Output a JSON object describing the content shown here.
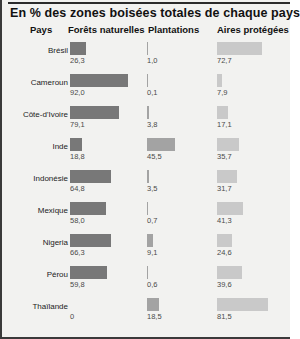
{
  "title": "En % des zones boisées totales de chaque pays",
  "columns": [
    "Pays",
    "Forêts naturelles",
    "Plantations",
    "Aires protégées"
  ],
  "colors": {
    "natural_forest": "#787878",
    "plantations": "#a3a3a3",
    "protected_areas": "#c9c9c9",
    "panel_background": "#f2f2f0",
    "frame": "#3a3a3a",
    "title_text": "#111111",
    "value_text": "#4a4a4a"
  },
  "chart_data": {
    "type": "bar",
    "title": "En % des zones boisées totales de chaque pays",
    "xlabel": "",
    "ylabel": "",
    "xlim": [
      0,
      100
    ],
    "grid": false,
    "legend_position": "column-headers",
    "orientation": "horizontal",
    "unit": "%",
    "categories": [
      "Brésil",
      "Cameroun",
      "Côte-d'Ivoire",
      "Inde",
      "Indonésie",
      "Mexique",
      "Nigeria",
      "Pérou",
      "Thaïlande"
    ],
    "series": [
      {
        "name": "Forêts naturelles",
        "color": "#787878",
        "values": [
          26.3,
          92.0,
          79.1,
          18.8,
          64.8,
          58.0,
          66.3,
          59.8,
          0
        ]
      },
      {
        "name": "Plantations",
        "color": "#a3a3a3",
        "values": [
          1.0,
          0.1,
          3.8,
          45.5,
          3.5,
          0.7,
          9.1,
          0.6,
          18.5
        ]
      },
      {
        "name": "Aires protégées",
        "color": "#c9c9c9",
        "values": [
          72.7,
          7.9,
          17.1,
          35.7,
          31.7,
          41.3,
          24.6,
          39.6,
          81.5
        ]
      }
    ]
  },
  "rows": [
    {
      "country": "Brésil",
      "v0": "26,3",
      "v1": "1,0",
      "v2": "72,7",
      "w0": 26.3,
      "w1": 1.0,
      "w2": 72.7
    },
    {
      "country": "Cameroun",
      "v0": "92,0",
      "v1": "0,1",
      "v2": "7,9",
      "w0": 92.0,
      "w1": 0.1,
      "w2": 7.9
    },
    {
      "country": "Côte-d'Ivoire",
      "v0": "79,1",
      "v1": "3,8",
      "v2": "17,1",
      "w0": 79.1,
      "w1": 3.8,
      "w2": 17.1
    },
    {
      "country": "Inde",
      "v0": "18,8",
      "v1": "45,5",
      "v2": "35,7",
      "w0": 18.8,
      "w1": 45.5,
      "w2": 35.7
    },
    {
      "country": "Indonésie",
      "v0": "64,8",
      "v1": "3,5",
      "v2": "31,7",
      "w0": 64.8,
      "w1": 3.5,
      "w2": 31.7
    },
    {
      "country": "Mexique",
      "v0": "58,0",
      "v1": "0,7",
      "v2": "41,3",
      "w0": 58.0,
      "w1": 0.7,
      "w2": 41.3
    },
    {
      "country": "Nigeria",
      "v0": "66,3",
      "v1": "9,1",
      "v2": "24,6",
      "w0": 66.3,
      "w1": 9.1,
      "w2": 24.6
    },
    {
      "country": "Pérou",
      "v0": "59,8",
      "v1": "0,6",
      "v2": "39,6",
      "w0": 59.8,
      "w1": 0.6,
      "w2": 39.6
    },
    {
      "country": "Thaïlande",
      "v0": "0",
      "v1": "18,5",
      "v2": "81,5",
      "w0": 0,
      "w1": 18.5,
      "w2": 81.5
    }
  ]
}
